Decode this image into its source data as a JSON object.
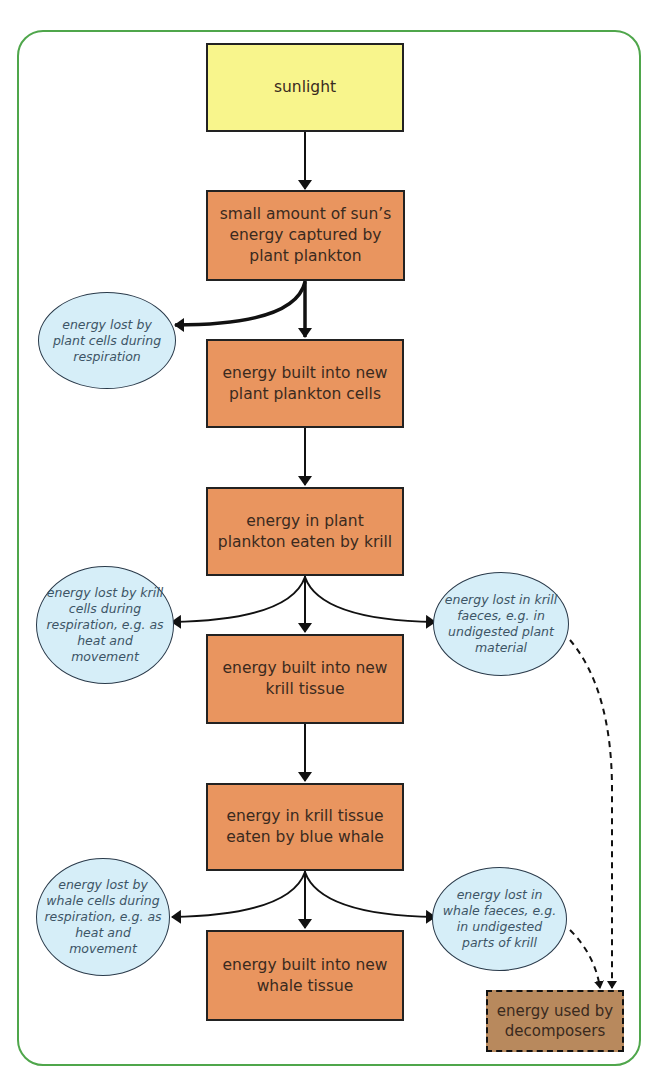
{
  "diagram": {
    "colors": {
      "frame": "#4fa64b",
      "sunlight_box": "#f8f58c",
      "stage_box": "#e9955f",
      "loss_ellipse": "#d6eef8",
      "decomposer_box": "#b8895d"
    },
    "nodes": {
      "sunlight": "sunlight",
      "captured": "small amount of sun’s energy captured by plant plankton",
      "plankton_cells": "energy built into new plant plankton cells",
      "eaten_by_krill": "energy in plant plankton eaten by krill",
      "krill_tissue": "energy built into new krill tissue",
      "eaten_by_whale": "energy in krill tissue eaten by blue whale",
      "whale_tissue": "energy built into new whale tissue",
      "decomposers": "energy used by decomposers"
    },
    "losses": {
      "plant_respiration": "energy lost by plant cells during respiration",
      "krill_respiration": "energy lost by krill cells during respiration, e.g. as heat and movement",
      "krill_faeces": "energy lost in krill faeces, e.g. in undigested plant material",
      "whale_respiration": "energy lost by whale cells during respiration, e.g. as heat and movement",
      "whale_faeces": "energy lost in whale faeces, e.g. in undigested parts of krill"
    }
  }
}
